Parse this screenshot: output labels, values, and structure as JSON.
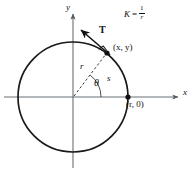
{
  "figure": {
    "type": "geometry-diagram",
    "width": 195,
    "height": 174,
    "background_color": "#ffffff",
    "stroke_color": "#1a1a1a"
  },
  "axes": {
    "x_label": "x",
    "y_label": "y",
    "origin": {
      "x": 73,
      "y": 97
    },
    "x_axis": {
      "x1": 4,
      "y1": 97,
      "x2": 180,
      "y2": 97
    },
    "y_axis": {
      "x1": 73,
      "y1": 168,
      "x2": 73,
      "y2": 12
    }
  },
  "circle": {
    "center_x": 73,
    "center_y": 97,
    "radius": 55,
    "stroke_width": 1.6
  },
  "points": [
    {
      "name": "point-on-circle",
      "label": "(x, y)",
      "x": 107,
      "y": 53
    },
    {
      "name": "point-x-axis",
      "label": "(r, 0)",
      "x": 128,
      "y": 97
    }
  ],
  "annotations": {
    "tangent_vector_label": "T",
    "radius_label": "r",
    "arc_label": "s",
    "angle_label": "θ"
  },
  "formula": {
    "symbol": "K",
    "equals": "=",
    "numerator": "1",
    "denominator": "r",
    "plain": "K = 1/r"
  },
  "elements": {
    "radius_line_style": "dashed",
    "right_angle_marker": true,
    "angle_arc": true,
    "arrowheads": [
      "x-axis",
      "y-axis",
      "tangent-vector"
    ]
  }
}
